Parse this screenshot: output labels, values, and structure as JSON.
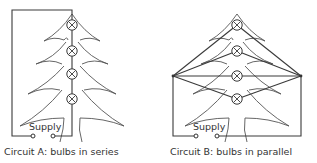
{
  "circuit_a": {
    "supply_label": "Supply",
    "caption": "Circuit A: bulbs in series",
    "bulb_count": 4
  },
  "circuit_b": {
    "supply_label": "Supply",
    "caption": "Circuit B: bulbs in parallel",
    "bulb_count": 4
  },
  "colors": {
    "line": "#3a3a3a",
    "text": "#333333",
    "background": "#ffffff"
  }
}
